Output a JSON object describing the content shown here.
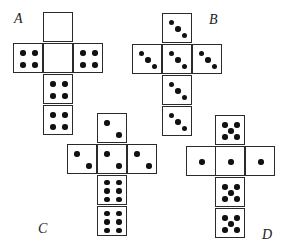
{
  "figure": {
    "face_size": 30,
    "colors": {
      "line": "#2a2a2a",
      "pip": "#111111",
      "background": "#ffffff"
    }
  },
  "nets": [
    {
      "id": "A",
      "label": "A",
      "label_pos": [
        14,
        12
      ],
      "faces": [
        {
          "name": "top",
          "x": 43,
          "y": 12,
          "pips": 0
        },
        {
          "name": "left",
          "x": 13,
          "y": 43,
          "pips": 4
        },
        {
          "name": "center",
          "x": 43,
          "y": 43,
          "pips": 0
        },
        {
          "name": "right",
          "x": 73,
          "y": 43,
          "pips": 4
        },
        {
          "name": "lower",
          "x": 43,
          "y": 74,
          "pips": 4
        },
        {
          "name": "bottom",
          "x": 43,
          "y": 105,
          "pips": 4
        }
      ]
    },
    {
      "id": "B",
      "label": "B",
      "label_pos": [
        209,
        13
      ],
      "faces": [
        {
          "name": "top",
          "x": 162,
          "y": 13,
          "pips": 3
        },
        {
          "name": "left",
          "x": 132,
          "y": 44,
          "pips": 3
        },
        {
          "name": "center",
          "x": 162,
          "y": 44,
          "pips": 3
        },
        {
          "name": "right",
          "x": 192,
          "y": 44,
          "pips": 3
        },
        {
          "name": "lower",
          "x": 162,
          "y": 75,
          "pips": 3
        },
        {
          "name": "bottom",
          "x": 162,
          "y": 106,
          "pips": 3
        }
      ]
    },
    {
      "id": "C",
      "label": "C",
      "label_pos": [
        38,
        222
      ],
      "faces": [
        {
          "name": "top",
          "x": 97,
          "y": 113,
          "pips": 2
        },
        {
          "name": "left",
          "x": 67,
          "y": 144,
          "pips": 2
        },
        {
          "name": "center",
          "x": 97,
          "y": 144,
          "pips": 2
        },
        {
          "name": "right",
          "x": 127,
          "y": 144,
          "pips": 2
        },
        {
          "name": "lower",
          "x": 97,
          "y": 175,
          "pips": 6
        },
        {
          "name": "bottom",
          "x": 97,
          "y": 206,
          "pips": 6
        }
      ]
    },
    {
      "id": "D",
      "label": "D",
      "label_pos": [
        262,
        228
      ],
      "faces": [
        {
          "name": "top",
          "x": 215,
          "y": 115,
          "pips": 5
        },
        {
          "name": "left",
          "x": 186,
          "y": 146,
          "pips": 1
        },
        {
          "name": "center",
          "x": 215,
          "y": 146,
          "pips": 1
        },
        {
          "name": "right",
          "x": 245,
          "y": 146,
          "pips": 1
        },
        {
          "name": "lower",
          "x": 215,
          "y": 177,
          "pips": 5
        },
        {
          "name": "bottom",
          "x": 215,
          "y": 208,
          "pips": 5
        }
      ]
    }
  ]
}
